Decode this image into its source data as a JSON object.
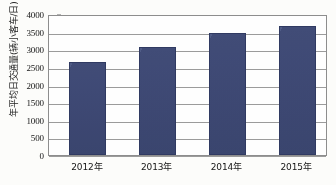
{
  "chart_data": {
    "type": "bar",
    "title": "",
    "xlabel": "",
    "ylabel": "年平均日交通量(辆小客车/日)",
    "categories": [
      "2012年",
      "2013年",
      "2014年",
      "2015年"
    ],
    "values": [
      2650,
      3060,
      3460,
      3650
    ],
    "ylim": [
      0,
      4000
    ],
    "ytick_labels": [
      "0",
      "500",
      "1000",
      "1500",
      "2000",
      "2500",
      "3000",
      "3500",
      "4000"
    ],
    "ytick_values": [
      0,
      500,
      1000,
      1500,
      2000,
      2500,
      3000,
      3500,
      4000
    ],
    "grid": "horizontal",
    "legend": "none",
    "series": [
      {
        "name": "年平均日交通量",
        "values": [
          2650,
          3060,
          3460,
          3650
        ],
        "color": "#3d4a77"
      }
    ]
  },
  "style": {
    "bar_color": "#3d4a77",
    "bar_border_color": "#2d3760",
    "grid_color": "#9a9a9a",
    "axis_color": "#8c8c8c",
    "text_color": "#111111",
    "background": "#fdfdfb"
  }
}
